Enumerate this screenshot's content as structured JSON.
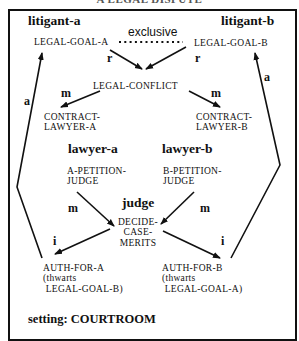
{
  "diagram": {
    "top_caption_cut": "A LEGAL DISPUTE",
    "roles": {
      "litigant_a": "litigant-a",
      "litigant_b": "litigant-b",
      "lawyer_a": "lawyer-a",
      "lawyer_b": "lawyer-b",
      "judge": "judge"
    },
    "nodes": {
      "legal_goal_a": "LEGAL-GOAL-A",
      "legal_goal_b": "LEGAL-GOAL-B",
      "legal_conflict": "LEGAL-CONFLICT",
      "contract_lawyer_a": "CONTRACT-\nLAWYER-A",
      "contract_lawyer_b": "CONTRACT-\nLAWYER-B",
      "a_petition_judge": "A-PETITION-\nJUDGE",
      "b_petition_judge": "B-PETITION-\nJUDGE",
      "decide_case_merits": "DECIDE-\nCASE-\nMERITS",
      "auth_for_a": "AUTH-FOR-A\n(thwarts\n LEGAL-GOAL-B)",
      "auth_for_b": "AUTH-FOR-B\n(thwarts\n LEGAL-GOAL-A)"
    },
    "relation_exclusive": "exclusive",
    "link_labels": {
      "r_left": "r",
      "r_right": "r",
      "m_conflict_left": "m",
      "m_conflict_right": "m",
      "m_judge_left": "m",
      "m_judge_right": "m",
      "i_left": "i",
      "i_right": "i",
      "a_left": "a",
      "a_right": "a"
    },
    "setting": "setting: COURTROOM"
  }
}
